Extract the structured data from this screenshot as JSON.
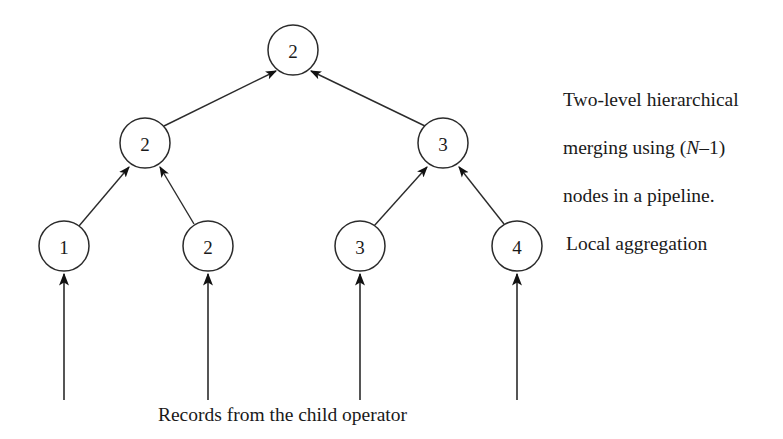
{
  "figure": {
    "type": "tree-diagram",
    "background_color": "#ffffff",
    "stroke_color": "#2b2b2b"
  },
  "nodes": [
    {
      "id": "root",
      "label": "2",
      "level": "root",
      "cx": 293,
      "cy": 50,
      "r": 25
    },
    {
      "id": "mid-l",
      "label": "2",
      "level": "merge",
      "cx": 145,
      "cy": 143,
      "r": 25
    },
    {
      "id": "mid-r",
      "label": "3",
      "level": "merge",
      "cx": 443,
      "cy": 143,
      "r": 25
    },
    {
      "id": "leaf-1",
      "label": "1",
      "level": "leaf",
      "cx": 64,
      "cy": 246,
      "r": 25
    },
    {
      "id": "leaf-2",
      "label": "2",
      "level": "leaf",
      "cx": 208,
      "cy": 246,
      "r": 25
    },
    {
      "id": "leaf-3",
      "label": "3",
      "level": "leaf",
      "cx": 360,
      "cy": 246,
      "r": 25
    },
    {
      "id": "leaf-4",
      "label": "4",
      "level": "leaf",
      "cx": 517,
      "cy": 246,
      "r": 25
    }
  ],
  "edges": [
    {
      "from": "mid-l",
      "to": "root",
      "arrow": "to"
    },
    {
      "from": "mid-r",
      "to": "root",
      "arrow": "to"
    },
    {
      "from": "leaf-1",
      "to": "mid-l",
      "arrow": "to"
    },
    {
      "from": "leaf-2",
      "to": "mid-l",
      "arrow": "to"
    },
    {
      "from": "leaf-3",
      "to": "mid-r",
      "arrow": "to"
    },
    {
      "from": "leaf-4",
      "to": "mid-r",
      "arrow": "to"
    }
  ],
  "input_arrows": [
    {
      "to": "leaf-1",
      "x": 64,
      "y_start": 400,
      "y_end": 273
    },
    {
      "to": "leaf-2",
      "x": 208,
      "y_start": 400,
      "y_end": 273
    },
    {
      "to": "leaf-3",
      "x": 360,
      "y_start": 400,
      "y_end": 273
    },
    {
      "to": "leaf-4",
      "x": 517,
      "y_start": 400,
      "y_end": 273
    }
  ],
  "annotations": {
    "hierarchical_line1": "Two-level hierarchical",
    "hierarchical_line2_pre": "merging using (",
    "hierarchical_line2_italic": "N",
    "hierarchical_line2_post": "–1)",
    "hierarchical_line3": "nodes in a pipeline.",
    "local_aggregation": "Local aggregation",
    "records_caption": "Records from the child operator"
  }
}
